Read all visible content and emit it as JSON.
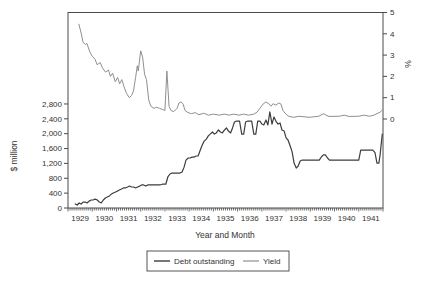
{
  "chart_data": {
    "type": "line",
    "title": "",
    "xlabel": "Year and Month",
    "ylabel_left": "$ million",
    "ylabel_right": "%",
    "x_axis": {
      "tick_labels": [
        "1929",
        "1930",
        "1931",
        "1932",
        "1933",
        "1934",
        "1935",
        "1936",
        "1937",
        "1938",
        "1939",
        "1940",
        "1941"
      ],
      "minor_ticks": "monthly",
      "range_years": [
        1929,
        1942
      ]
    },
    "y_left_axis": {
      "min": 0,
      "max": 2800,
      "step": 400,
      "tick_labels": [
        "0",
        "400",
        "800",
        "1,200",
        "1,600",
        "2,000",
        "2,400",
        "2,800"
      ]
    },
    "y_right_axis": {
      "min": 0,
      "max": 5,
      "step": 1,
      "tick_labels": [
        "0",
        "1",
        "2",
        "3",
        "4",
        "5"
      ]
    },
    "grid": "off",
    "legend": {
      "position": "bottom",
      "items": [
        {
          "label": "Debt outstanding",
          "color": "#3d3d3d"
        },
        {
          "label": "Yield",
          "color": "#8f8f8f"
        }
      ]
    },
    "series": [
      {
        "name": "Debt outstanding",
        "axis": "left",
        "unit": "$ million",
        "color": "#3d3d3d",
        "stroke_width": 1.2,
        "points": [
          [
            1929.3,
            110
          ],
          [
            1929.38,
            80
          ],
          [
            1929.46,
            135
          ],
          [
            1929.54,
            105
          ],
          [
            1929.62,
            160
          ],
          [
            1929.71,
            160
          ],
          [
            1929.79,
            135
          ],
          [
            1929.87,
            185
          ],
          [
            1929.96,
            215
          ],
          [
            1930.04,
            215
          ],
          [
            1930.12,
            240
          ],
          [
            1930.21,
            215
          ],
          [
            1930.29,
            160
          ],
          [
            1930.37,
            135
          ],
          [
            1930.46,
            215
          ],
          [
            1930.54,
            270
          ],
          [
            1930.62,
            295
          ],
          [
            1930.71,
            325
          ],
          [
            1930.79,
            375
          ],
          [
            1930.87,
            405
          ],
          [
            1930.96,
            430
          ],
          [
            1931.04,
            455
          ],
          [
            1931.12,
            485
          ],
          [
            1931.21,
            510
          ],
          [
            1931.29,
            540
          ],
          [
            1931.37,
            540
          ],
          [
            1931.46,
            565
          ],
          [
            1931.54,
            590
          ],
          [
            1931.62,
            565
          ],
          [
            1931.71,
            565
          ],
          [
            1931.79,
            540
          ],
          [
            1931.87,
            565
          ],
          [
            1931.96,
            590
          ],
          [
            1932.04,
            620
          ],
          [
            1932.12,
            620
          ],
          [
            1932.21,
            590
          ],
          [
            1932.29,
            620
          ],
          [
            1932.46,
            620
          ],
          [
            1932.62,
            620
          ],
          [
            1932.79,
            620
          ],
          [
            1932.92,
            645
          ],
          [
            1933.04,
            645
          ],
          [
            1933.12,
            835
          ],
          [
            1933.21,
            915
          ],
          [
            1933.29,
            940
          ],
          [
            1933.46,
            940
          ],
          [
            1933.62,
            940
          ],
          [
            1933.71,
            970
          ],
          [
            1933.79,
            1100
          ],
          [
            1933.87,
            1290
          ],
          [
            1933.96,
            1345
          ],
          [
            1934.04,
            1345
          ],
          [
            1934.12,
            1370
          ],
          [
            1934.21,
            1370
          ],
          [
            1934.29,
            1400
          ],
          [
            1934.37,
            1400
          ],
          [
            1934.46,
            1560
          ],
          [
            1934.54,
            1695
          ],
          [
            1934.62,
            1800
          ],
          [
            1934.71,
            1855
          ],
          [
            1934.79,
            1940
          ],
          [
            1934.87,
            1990
          ],
          [
            1934.96,
            2045
          ],
          [
            1935.04,
            1990
          ],
          [
            1935.12,
            2020
          ],
          [
            1935.21,
            2100
          ],
          [
            1935.29,
            2045
          ],
          [
            1935.37,
            2020
          ],
          [
            1935.46,
            2100
          ],
          [
            1935.54,
            2155
          ],
          [
            1935.62,
            2070
          ],
          [
            1935.71,
            2020
          ],
          [
            1935.79,
            2155
          ],
          [
            1935.87,
            2315
          ],
          [
            1935.96,
            2340
          ],
          [
            1936.08,
            2340
          ],
          [
            1936.17,
            1990
          ],
          [
            1936.25,
            1990
          ],
          [
            1936.33,
            2315
          ],
          [
            1936.42,
            2340
          ],
          [
            1936.58,
            2340
          ],
          [
            1936.67,
            1990
          ],
          [
            1936.75,
            1990
          ],
          [
            1936.83,
            2340
          ],
          [
            1936.92,
            2340
          ],
          [
            1937.0,
            2260
          ],
          [
            1937.08,
            2235
          ],
          [
            1937.17,
            2370
          ],
          [
            1937.25,
            2235
          ],
          [
            1937.33,
            2585
          ],
          [
            1937.42,
            2260
          ],
          [
            1937.5,
            2450
          ],
          [
            1937.58,
            2340
          ],
          [
            1937.67,
            2260
          ],
          [
            1937.75,
            2290
          ],
          [
            1937.83,
            2100
          ],
          [
            1937.92,
            2070
          ],
          [
            1938.0,
            1885
          ],
          [
            1938.08,
            1830
          ],
          [
            1938.17,
            1670
          ],
          [
            1938.25,
            1510
          ],
          [
            1938.33,
            1210
          ],
          [
            1938.42,
            1075
          ],
          [
            1938.5,
            1130
          ],
          [
            1938.58,
            1265
          ],
          [
            1938.67,
            1290
          ],
          [
            1939.0,
            1290
          ],
          [
            1939.37,
            1290
          ],
          [
            1939.46,
            1380
          ],
          [
            1939.54,
            1430
          ],
          [
            1939.62,
            1430
          ],
          [
            1939.71,
            1345
          ],
          [
            1939.79,
            1290
          ],
          [
            1940.2,
            1290
          ],
          [
            1940.6,
            1290
          ],
          [
            1941.0,
            1290
          ],
          [
            1941.08,
            1560
          ],
          [
            1941.17,
            1560
          ],
          [
            1941.42,
            1560
          ],
          [
            1941.58,
            1560
          ],
          [
            1941.67,
            1490
          ],
          [
            1941.75,
            1210
          ],
          [
            1941.83,
            1210
          ],
          [
            1941.88,
            1430
          ],
          [
            1941.97,
            1990
          ]
        ]
      },
      {
        "name": "Yield",
        "axis": "right",
        "unit": "%",
        "color": "#8f8f8f",
        "stroke_width": 1,
        "points": [
          [
            1929.45,
            4.45
          ],
          [
            1929.55,
            4.0
          ],
          [
            1929.62,
            3.6
          ],
          [
            1929.72,
            3.5
          ],
          [
            1929.78,
            3.55
          ],
          [
            1929.9,
            3.15
          ],
          [
            1930.0,
            2.95
          ],
          [
            1930.12,
            2.8
          ],
          [
            1930.2,
            2.55
          ],
          [
            1930.33,
            2.65
          ],
          [
            1930.42,
            2.4
          ],
          [
            1930.55,
            2.2
          ],
          [
            1930.67,
            2.3
          ],
          [
            1930.75,
            2.0
          ],
          [
            1930.84,
            2.15
          ],
          [
            1930.95,
            1.75
          ],
          [
            1931.05,
            1.95
          ],
          [
            1931.13,
            1.65
          ],
          [
            1931.22,
            1.85
          ],
          [
            1931.33,
            1.45
          ],
          [
            1931.42,
            1.2
          ],
          [
            1931.53,
            1.0
          ],
          [
            1931.62,
            1.1
          ],
          [
            1931.7,
            1.3
          ],
          [
            1931.79,
            1.95
          ],
          [
            1931.86,
            2.5
          ],
          [
            1931.9,
            2.25
          ],
          [
            1932.0,
            3.2
          ],
          [
            1932.08,
            2.9
          ],
          [
            1932.16,
            2.1
          ],
          [
            1932.24,
            1.85
          ],
          [
            1932.33,
            0.9
          ],
          [
            1932.42,
            0.6
          ],
          [
            1932.55,
            0.5
          ],
          [
            1932.65,
            0.55
          ],
          [
            1932.78,
            0.5
          ],
          [
            1932.9,
            0.45
          ],
          [
            1933.0,
            0.4
          ],
          [
            1933.08,
            2.25
          ],
          [
            1933.13,
            1.35
          ],
          [
            1933.17,
            0.6
          ],
          [
            1933.25,
            0.4
          ],
          [
            1933.37,
            0.35
          ],
          [
            1933.5,
            0.5
          ],
          [
            1933.58,
            0.75
          ],
          [
            1933.67,
            0.8
          ],
          [
            1933.75,
            0.7
          ],
          [
            1933.83,
            0.4
          ],
          [
            1933.95,
            0.3
          ],
          [
            1934.1,
            0.25
          ],
          [
            1934.25,
            0.3
          ],
          [
            1934.4,
            0.2
          ],
          [
            1934.6,
            0.27
          ],
          [
            1934.8,
            0.18
          ],
          [
            1935.0,
            0.23
          ],
          [
            1935.25,
            0.18
          ],
          [
            1935.45,
            0.23
          ],
          [
            1935.65,
            0.18
          ],
          [
            1935.85,
            0.23
          ],
          [
            1936.05,
            0.18
          ],
          [
            1936.25,
            0.23
          ],
          [
            1936.45,
            0.18
          ],
          [
            1936.67,
            0.23
          ],
          [
            1936.8,
            0.32
          ],
          [
            1936.92,
            0.5
          ],
          [
            1937.05,
            0.7
          ],
          [
            1937.17,
            0.8
          ],
          [
            1937.3,
            0.7
          ],
          [
            1937.38,
            0.6
          ],
          [
            1937.46,
            0.72
          ],
          [
            1937.58,
            0.65
          ],
          [
            1937.7,
            0.75
          ],
          [
            1937.79,
            0.7
          ],
          [
            1937.87,
            0.4
          ],
          [
            1938.0,
            0.22
          ],
          [
            1938.12,
            0.12
          ],
          [
            1938.33,
            0.08
          ],
          [
            1938.53,
            0.13
          ],
          [
            1938.95,
            0.08
          ],
          [
            1939.35,
            0.13
          ],
          [
            1939.55,
            0.25
          ],
          [
            1939.65,
            0.18
          ],
          [
            1939.77,
            0.12
          ],
          [
            1940.2,
            0.13
          ],
          [
            1940.4,
            0.18
          ],
          [
            1940.6,
            0.12
          ],
          [
            1941.0,
            0.13
          ],
          [
            1941.2,
            0.18
          ],
          [
            1941.45,
            0.13
          ],
          [
            1941.62,
            0.18
          ],
          [
            1941.75,
            0.25
          ],
          [
            1941.88,
            0.32
          ],
          [
            1941.97,
            0.42
          ]
        ]
      }
    ]
  }
}
